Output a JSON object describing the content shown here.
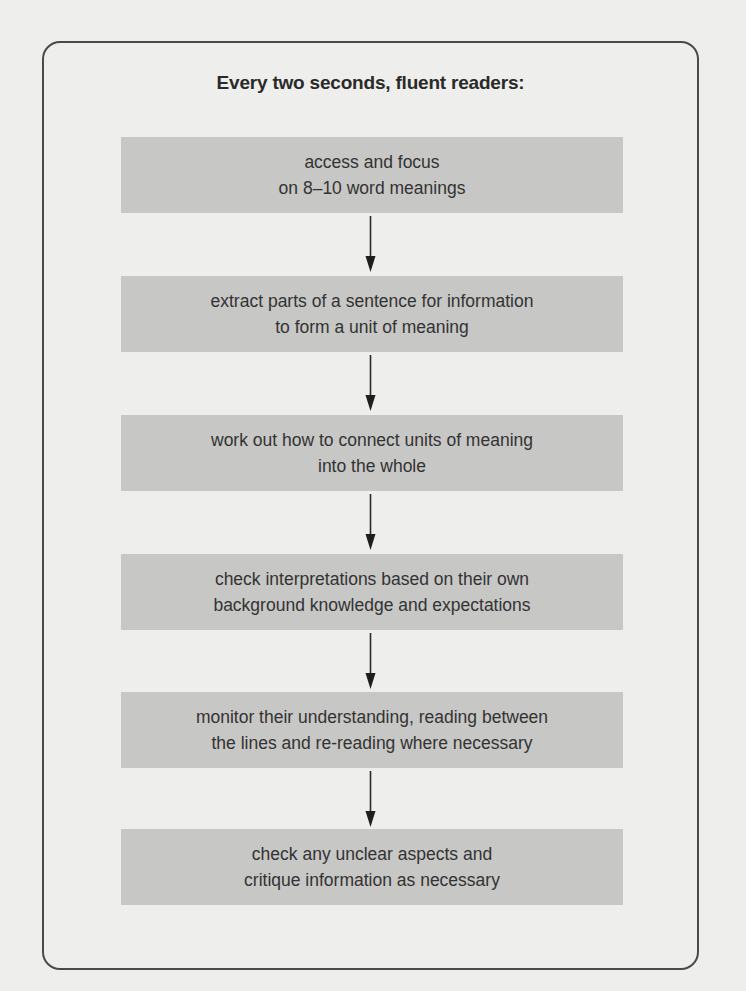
{
  "title": "Every two seconds, fluent readers:",
  "steps": [
    {
      "line1": "access and focus",
      "line2": "on 8–10 word meanings"
    },
    {
      "line1": "extract parts of a sentence for information",
      "line2": "to form a unit of meaning"
    },
    {
      "line1": "work out how to connect units of meaning",
      "line2": "into the whole"
    },
    {
      "line1": "check interpretations based on their own",
      "line2": "background knowledge and expectations"
    },
    {
      "line1": "monitor their understanding, reading between",
      "line2": "the lines and re-reading where necessary"
    },
    {
      "line1": "check any unclear aspects and",
      "line2": "critique information as necessary"
    }
  ],
  "colors": {
    "background": "#eeeeec",
    "box_fill": "#c7c7c5",
    "border": "#4a4a4a",
    "text": "#2a2a2a"
  },
  "connectors": [
    "down-arrow",
    "down-arrow",
    "down-arrow",
    "down-arrow",
    "down-arrow"
  ]
}
